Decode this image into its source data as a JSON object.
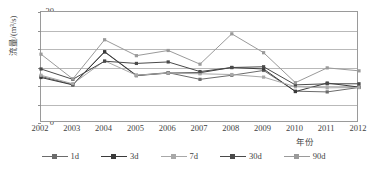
{
  "chart_data": {
    "type": "line",
    "title": "",
    "xlabel": "年份",
    "ylabel": "流量/(m³/s)",
    "categories": [
      "2002",
      "2003",
      "2004",
      "2005",
      "2006",
      "2007",
      "2008",
      "2009",
      "2010",
      "2011",
      "2012"
    ],
    "x": [
      2002,
      2003,
      2004,
      2005,
      2006,
      2007,
      2008,
      2009,
      2010,
      2011,
      2012
    ],
    "ylim": [
      0,
      30
    ],
    "yticks": [
      0,
      5,
      10,
      15,
      20,
      25,
      30
    ],
    "xlim": [
      2002,
      2012
    ],
    "grid": "horizontal",
    "legend_position": "bottom",
    "series": [
      {
        "name": "1d",
        "color": "#6b6b6b",
        "values": [
          12.6,
          10.4,
          19.3,
          12.9,
          13.6,
          11.8,
          12.9,
          14.2,
          8.6,
          8.4,
          9.6
        ]
      },
      {
        "name": "3d",
        "color": "#3a3a3a",
        "values": [
          12.3,
          10.3,
          19.2,
          12.8,
          13.5,
          13.6,
          15.0,
          14.6,
          8.5,
          10.8,
          9.7
        ]
      },
      {
        "name": "7d",
        "color": "#a8a8a8",
        "values": [
          12.9,
          10.6,
          16.8,
          12.9,
          13.5,
          13.3,
          13.1,
          12.4,
          9.8,
          9.5,
          9.6
        ]
      },
      {
        "name": "30d",
        "color": "#4a4a4a",
        "values": [
          14.6,
          11.8,
          16.7,
          16.1,
          16.5,
          13.9,
          15.0,
          15.2,
          10.3,
          10.6,
          10.6
        ]
      },
      {
        "name": "90d",
        "color": "#9a9a9a",
        "values": [
          18.6,
          11.9,
          22.5,
          18.2,
          19.6,
          15.9,
          24.1,
          19.0,
          10.9,
          14.9,
          14.1
        ]
      }
    ]
  },
  "legend": {
    "items": [
      {
        "label": "1d"
      },
      {
        "label": "3d"
      },
      {
        "label": "7d"
      },
      {
        "label": "30d"
      },
      {
        "label": "90d"
      }
    ]
  }
}
